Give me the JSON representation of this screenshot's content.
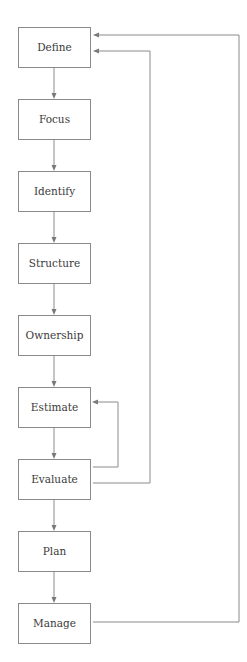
{
  "diagram": {
    "type": "flowchart",
    "colors": {
      "box_stroke": "#8a8a8a",
      "line": "#8a8a8a",
      "text": "#3a3a3a",
      "background": "#ffffff"
    },
    "nodes": [
      {
        "id": "define",
        "label": "Define"
      },
      {
        "id": "focus",
        "label": "Focus"
      },
      {
        "id": "identify",
        "label": "Identify"
      },
      {
        "id": "structure",
        "label": "Structure"
      },
      {
        "id": "ownership",
        "label": "Ownership"
      },
      {
        "id": "estimate",
        "label": "Estimate"
      },
      {
        "id": "evaluate",
        "label": "Evaluate"
      },
      {
        "id": "plan",
        "label": "Plan"
      },
      {
        "id": "manage",
        "label": "Manage"
      }
    ],
    "edges": [
      {
        "from": "define",
        "to": "focus"
      },
      {
        "from": "focus",
        "to": "identify"
      },
      {
        "from": "identify",
        "to": "structure"
      },
      {
        "from": "structure",
        "to": "ownership"
      },
      {
        "from": "ownership",
        "to": "estimate"
      },
      {
        "from": "estimate",
        "to": "evaluate"
      },
      {
        "from": "evaluate",
        "to": "plan"
      },
      {
        "from": "plan",
        "to": "manage"
      },
      {
        "from": "evaluate",
        "to": "estimate",
        "kind": "feedback"
      },
      {
        "from": "evaluate",
        "to": "define",
        "kind": "feedback"
      },
      {
        "from": "manage",
        "to": "define",
        "kind": "feedback"
      }
    ]
  }
}
